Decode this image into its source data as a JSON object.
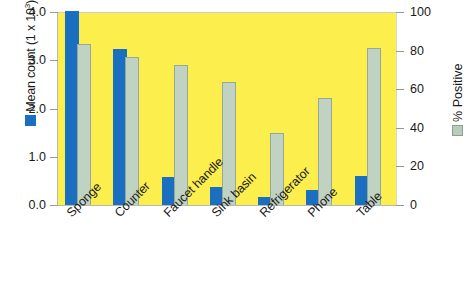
{
  "chart_data": {
    "type": "bar",
    "title": "",
    "categories": [
      "Sponge",
      "Counter",
      "Faucet handle",
      "Sink basin",
      "Refrigerator",
      "Phone",
      "Table"
    ],
    "series": [
      {
        "name": "Mean count (1 x 10^3)",
        "axis": "left",
        "color": "#1b6fc0",
        "values": [
          4.35,
          3.22,
          0.55,
          0.36,
          0.15,
          0.29,
          0.58
        ],
        "clipped": [
          true,
          false,
          false,
          false,
          false,
          false,
          false
        ]
      },
      {
        "name": "% Positive",
        "axis": "right",
        "color": "#c0d2c2",
        "values": [
          83,
          76,
          72,
          63,
          37,
          55,
          81
        ]
      }
    ],
    "left_axis": {
      "label_prefix": "Mean count (1 x 10",
      "label_exponent": "3",
      "label_suffix": ")",
      "ticks": [
        "4.0",
        "3.0",
        "2.0",
        "1.0",
        "0.0"
      ],
      "min": 0.0,
      "max": 4.0,
      "step": 1.0,
      "legend_swatch_color": "#1b6fc0"
    },
    "right_axis": {
      "label": "% Positive",
      "ticks": [
        "100",
        "80",
        "60",
        "40",
        "20",
        "0"
      ],
      "min": 0,
      "max": 100,
      "step": 20,
      "legend_swatch_color": "#c0d2c2"
    },
    "xlabel": "",
    "grid": false,
    "legend_position": "axis-titles",
    "plot_background_color": "#fbee4d"
  },
  "left_ticks": [
    {
      "label": "4.0"
    },
    {
      "label": "3.0"
    },
    {
      "label": "2.0"
    },
    {
      "label": "1.0"
    },
    {
      "label": "0.0"
    }
  ],
  "right_ticks": [
    {
      "label": "100"
    },
    {
      "label": "80"
    },
    {
      "label": "60"
    },
    {
      "label": "40"
    },
    {
      "label": "20"
    },
    {
      "label": "0"
    }
  ],
  "categories": [
    {
      "label": "Sponge"
    },
    {
      "label": "Counter"
    },
    {
      "label": "Faucet handle"
    },
    {
      "label": "Sink basin"
    },
    {
      "label": "Refrigerator"
    },
    {
      "label": "Phone"
    },
    {
      "label": "Table"
    }
  ],
  "axis_titles": {
    "left_prefix": "Mean count (1 x 10",
    "left_exponent": "3",
    "left_suffix": ")",
    "right": "% Positive"
  }
}
